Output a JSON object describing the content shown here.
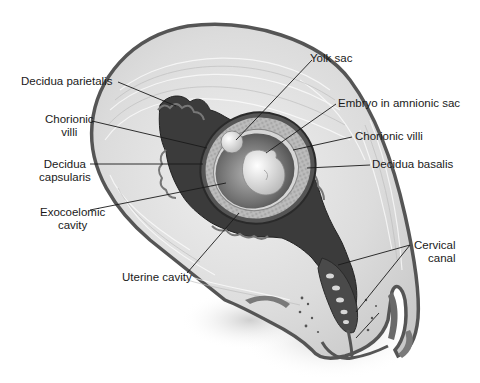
{
  "figure": {
    "type": "anatomical-illustration",
    "colors": {
      "myometrium": "#d9d9d9",
      "serosa": "#5a5a5a",
      "decidua": "#3c3c3c",
      "chorion": "#9a9a9a",
      "sac_fluid": "#7a7a7a",
      "embryo": "#e6e6e6",
      "background": "#ffffff"
    }
  },
  "labels": {
    "decidua_parietalis": "Decidua parietalis",
    "chorionic_villi_left": [
      "Chorionic",
      "villi"
    ],
    "decidua_capsularis": [
      "Decidua",
      "capsularis"
    ],
    "exocoelomic_cavity": [
      "Exocoelomic",
      "cavity"
    ],
    "uterine_cavity": "Uterine cavity",
    "yolk_sac": "Yolk sac",
    "embryo_in_amnionic_sac": "Embryo in amnionic sac",
    "chorionic_villi_right": "Chorionic villi",
    "decidua_basalis": "Decidua basalis",
    "cervical_canal": [
      "Cervical",
      "canal"
    ]
  }
}
